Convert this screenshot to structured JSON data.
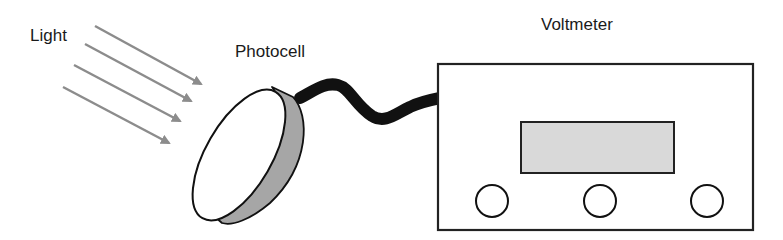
{
  "labels": {
    "light": "Light",
    "photocell": "Photocell",
    "voltmeter": "Voltmeter"
  },
  "colors": {
    "arrow": "#8c8c8c",
    "outline": "#111111",
    "photocell_face": "#ffffff",
    "photocell_rim": "#a6a6a6",
    "cable": "#111111",
    "display": "#d9d9d9",
    "knob": "#ffffff"
  },
  "light_rays": [
    {
      "x1": 95,
      "y1": 26,
      "x2": 201,
      "y2": 84
    },
    {
      "x1": 85,
      "y1": 44,
      "x2": 191,
      "y2": 101
    },
    {
      "x1": 74,
      "y1": 65,
      "x2": 180,
      "y2": 121
    },
    {
      "x1": 63,
      "y1": 87,
      "x2": 169,
      "y2": 143
    }
  ],
  "voltmeter": {
    "body": {
      "x": 438,
      "y": 64,
      "w": 315,
      "h": 166
    },
    "display": {
      "x": 521,
      "y": 122,
      "w": 153,
      "h": 51
    },
    "knobs": [
      {
        "cx": 492,
        "cy": 201,
        "r": 16
      },
      {
        "cx": 600,
        "cy": 201,
        "r": 16
      },
      {
        "cx": 707,
        "cy": 201,
        "r": 16
      }
    ]
  }
}
